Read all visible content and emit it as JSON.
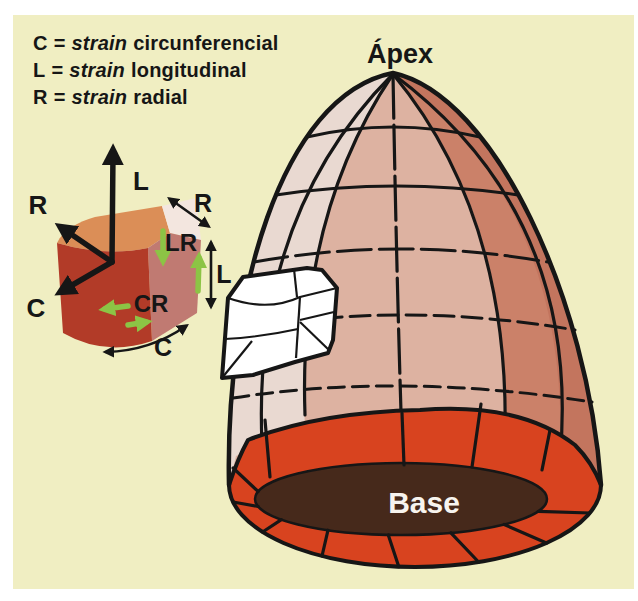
{
  "legend": {
    "items": [
      {
        "term": "C",
        "eq": "=",
        "italic": "strain",
        "rest": "circunferencial"
      },
      {
        "term": "L",
        "eq": "=",
        "italic": "strain",
        "rest": "longitudinal"
      },
      {
        "term": "R",
        "eq": "=",
        "italic": "strain",
        "rest": "radial"
      }
    ]
  },
  "model": {
    "apex_label": "Ápex",
    "base_label": "Base"
  },
  "strain_axes": {
    "longitudinal": "L",
    "radial": "R",
    "circumferential": "C"
  },
  "block_annotations": {
    "shear_lr": "LR",
    "shear_cr": "CR",
    "dim_l": "L",
    "dim_r": "R",
    "dim_c": "C"
  },
  "colors": {
    "page": "#ffffff",
    "panel": "#f0eec2",
    "ink": "#161616",
    "white": "#ffffff",
    "green": "#8cc445",
    "dome_mid": "#ddb2a1",
    "dome_light": "#e9d9d1",
    "dome_dark": "#cb8169",
    "dome_darker": "#c3755e",
    "ring_red": "#d8431f",
    "cavity_brown": "#46291b",
    "block_front": "#b23b28",
    "block_top": "#db8e57",
    "block_side": "#c07a72",
    "block_sliver": "#f3e6df",
    "base_text": "#f7f4ef"
  }
}
